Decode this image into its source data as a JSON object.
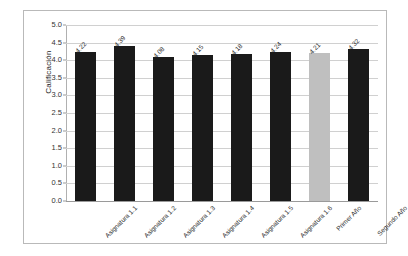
{
  "chart_data": {
    "type": "bar",
    "title": "",
    "xlabel": "",
    "ylabel": "Calificación",
    "ylim": [
      0.0,
      5.0
    ],
    "ytick_step": 0.5,
    "grid": true,
    "legend": "none",
    "categories": [
      "Asignatura 1.1",
      "Asignatura 1.2",
      "Asignatura 1.3",
      "Asignatura 1.4",
      "Asignatura 1.5",
      "Asignatura 1.6",
      "Primer Año",
      "Segundo Año"
    ],
    "values": [
      4.22,
      4.39,
      4.08,
      4.15,
      4.18,
      4.24,
      4.21,
      4.32
    ],
    "value_labels": [
      "4.22",
      "4.39",
      "4.08",
      "4.15",
      "4.18",
      "4.24",
      "4.21",
      "4.32"
    ],
    "ytick_labels": [
      "0.0",
      "0.5",
      "1.0",
      "1.5",
      "2.0",
      "2.5",
      "3.0",
      "3.5",
      "4.0",
      "4.5",
      "5.0"
    ],
    "bar_colors": [
      "#1a1a1a",
      "#1a1a1a",
      "#1a1a1a",
      "#1a1a1a",
      "#1a1a1a",
      "#1a1a1a",
      "#bfbfbf",
      "#1a1a1a"
    ],
    "highlight_index": 6,
    "colors": {
      "bar_default": "#1a1a1a",
      "bar_highlight": "#bfbfbf",
      "gridline": "#d0d0d0",
      "axis": "#9a9a9a",
      "frame": "#b9b9b9",
      "text": "#2b2b2b",
      "background": "#ffffff"
    }
  }
}
